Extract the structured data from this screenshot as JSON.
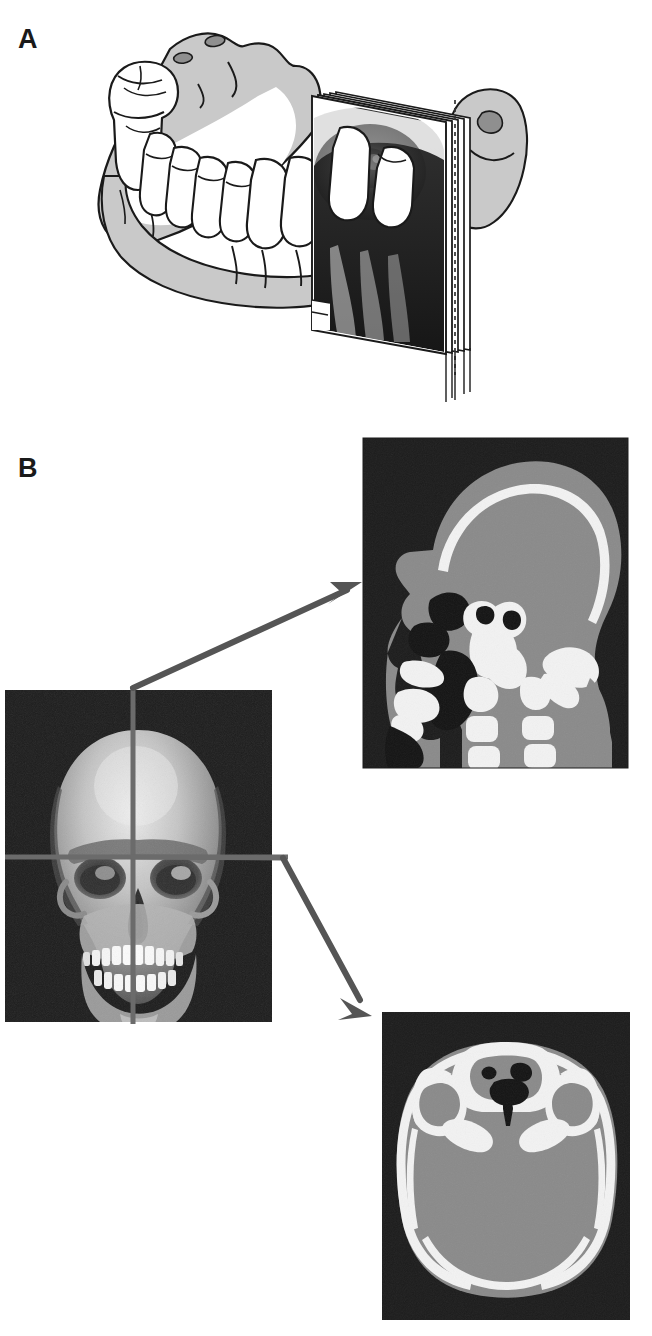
{
  "figure": {
    "type": "medical-illustration-figure",
    "background_color": "#ffffff",
    "width": 652,
    "height": 1336,
    "panels": [
      {
        "id": "A",
        "label": "A",
        "label_position": {
          "x": 18,
          "y": 26
        },
        "description": "Line drawing of a human mandible (lower jaw) in oblique view with dentition, and an intraoral dental radiograph film packet stack positioned against the posterior teeth showing a periapical x-ray image",
        "elements": [
          {
            "name": "mandible-body",
            "type": "bone-outline",
            "fill": "#c9c9c9",
            "stroke": "#1a1a1a"
          },
          {
            "name": "teeth-arch",
            "type": "dentition",
            "count": 12,
            "fill": "#ffffff",
            "stroke": "#1a1a1a"
          },
          {
            "name": "molar-left-posterior",
            "type": "molar-tooth",
            "fill": "#ffffff"
          },
          {
            "name": "radiograph-film-stack",
            "type": "film-packet",
            "sheets": 5,
            "fill": "#ffffff",
            "stroke": "#1a1a1a"
          },
          {
            "name": "radiograph-image",
            "type": "xray-exposure",
            "fill": "#1e1e1e"
          },
          {
            "name": "condyle-right",
            "type": "mandibular-condyle",
            "fill": "#c9c9c9"
          },
          {
            "name": "projection-dashed-line",
            "type": "dashed-guide",
            "stroke": "#333333"
          }
        ]
      },
      {
        "id": "B",
        "label": "B",
        "label_position": {
          "x": 18,
          "y": 455
        },
        "description": "Volume-rendered frontal skull CT with orthogonal reference crosshairs, with arrows pointing to a mid-sagittal CT slice of the head (upper right) and an axial CT slice through the skull base (lower right)",
        "elements": [
          {
            "name": "skull-frontal-view",
            "type": "volume-render",
            "bounds": {
              "x": 5,
              "y": 690,
              "w": 267,
              "h": 332
            },
            "background": "#1c1c1c"
          },
          {
            "name": "crosshair-vertical",
            "type": "reference-line",
            "orientation": "vertical",
            "x": 133,
            "color": "#6b6b6b"
          },
          {
            "name": "crosshair-horizontal",
            "type": "reference-line",
            "orientation": "horizontal",
            "y": 857,
            "color": "#6b6b6b"
          },
          {
            "name": "arrow-to-sagittal",
            "type": "pointer-arrow",
            "from": {
              "x": 133,
              "y": 688
            },
            "to": {
              "x": 360,
              "y": 588
            },
            "color": "#555555"
          },
          {
            "name": "arrow-to-axial",
            "type": "pointer-arrow",
            "from": {
              "x": 283,
              "y": 858
            },
            "to": {
              "x": 372,
              "y": 1014
            },
            "color": "#555555"
          },
          {
            "name": "sagittal-ct-slice",
            "type": "ct-slice",
            "plane": "sagittal",
            "bounds": {
              "x": 363,
              "y": 438,
              "w": 265,
              "h": 330
            },
            "background": "#1c1c1c",
            "soft_tissue": "#8a8a8a",
            "bone": "#f2f2f2",
            "air": "#151515"
          },
          {
            "name": "axial-ct-slice",
            "type": "ct-slice",
            "plane": "axial",
            "bounds": {
              "x": 382,
              "y": 1012,
              "w": 248,
              "h": 308
            },
            "background": "#1c1c1c",
            "soft_tissue": "#8a8a8a",
            "bone": "#f2f2f2",
            "air": "#151515"
          }
        ]
      }
    ]
  },
  "colors": {
    "paper": "#ffffff",
    "ink": "#1a1a1a",
    "bone_gray": "#c9c9c9",
    "ct_background": "#1c1c1c",
    "ct_soft_tissue": "#8a8a8a",
    "ct_bone": "#f2f2f2",
    "ct_air": "#141414",
    "arrow_gray": "#555555",
    "crosshair_gray": "#6b6b6b"
  }
}
